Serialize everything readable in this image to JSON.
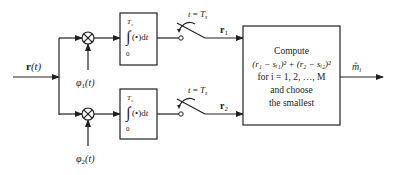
{
  "diagram": {
    "type": "block-diagram",
    "input": {
      "label_main": "r",
      "label_arg": "(t)"
    },
    "branches": [
      {
        "id": "branch-1",
        "basis": {
          "label_main": "φ",
          "label_sub": "1",
          "label_arg": "(t)"
        },
        "integrator": {
          "upper_limit": "T",
          "upper_limit_sub": "s",
          "lower_limit": "0",
          "integrand": "(•)d",
          "var": "t"
        },
        "sampler": {
          "label_t": "t",
          "label_eq": " = ",
          "label_T": "T",
          "label_T_sub": "s"
        },
        "output": {
          "label_main": "r",
          "label_sub": "1"
        }
      },
      {
        "id": "branch-2",
        "basis": {
          "label_main": "φ",
          "label_sub": "2",
          "label_arg": "(t)"
        },
        "integrator": {
          "upper_limit": "T",
          "upper_limit_sub": "s",
          "lower_limit": "0",
          "integrand": "(•)d",
          "var": "t"
        },
        "sampler": {
          "label_t": "t",
          "label_eq": " = ",
          "label_T": "T",
          "label_T_sub": "s"
        },
        "output": {
          "label_main": "r",
          "label_sub": "2"
        }
      }
    ],
    "decision_box": {
      "line1": "Compute",
      "line2": "(r₁ − sᵢ₁)² + (r₂ − sᵢ₂)²",
      "line3": "for i = 1, 2, …, M",
      "line4": "and choose",
      "line5": "the smallest"
    },
    "output": {
      "label_main": "m̂",
      "label_sub": "i"
    },
    "multiplier_symbol": "⊗"
  }
}
